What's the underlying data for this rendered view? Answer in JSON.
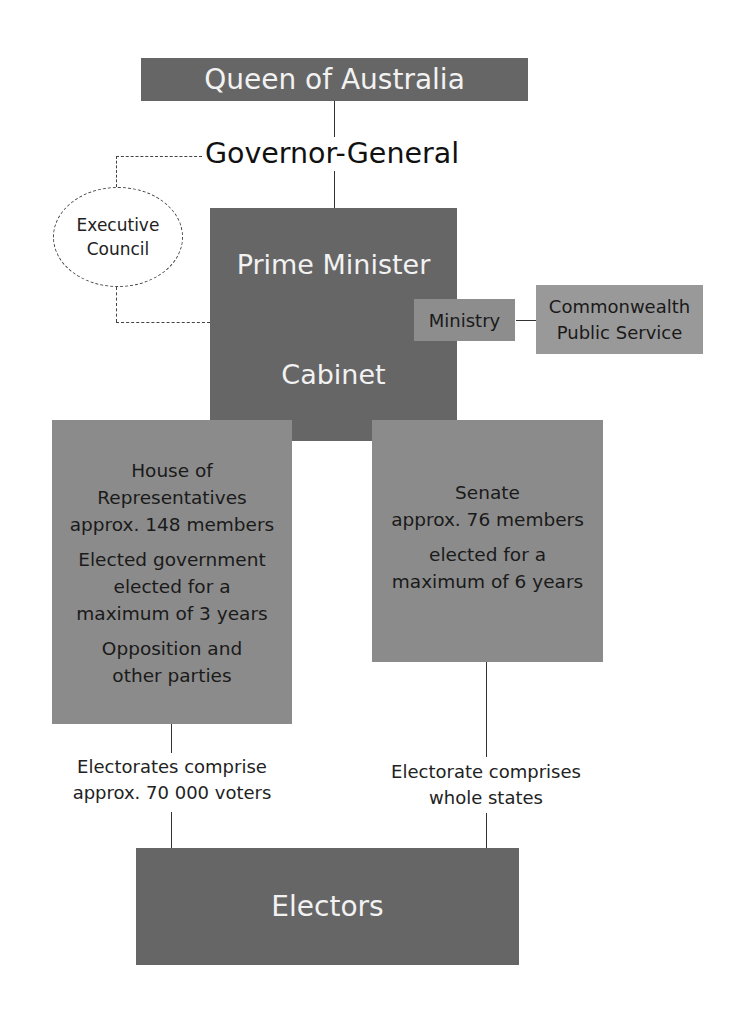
{
  "diagram": {
    "nodes": {
      "queen": {
        "label": "Queen of Australia"
      },
      "governor_general": {
        "label": "Governor-General"
      },
      "executive_council": {
        "line1": "Executive",
        "line2": "Council"
      },
      "prime_minister": {
        "label": "Prime Minister"
      },
      "cabinet": {
        "label": "Cabinet"
      },
      "ministry": {
        "label": "Ministry"
      },
      "public_service": {
        "line1": "Commonwealth",
        "line2": "Public Service"
      },
      "house": {
        "lines": [
          "House of",
          "Representatives",
          "approx. 148 members",
          "Elected government",
          "elected for a",
          "maximum of 3 years",
          "Opposition and",
          "other parties"
        ]
      },
      "senate": {
        "lines": [
          "Senate",
          "approx. 76 members",
          "elected for a",
          "maximum of 6 years"
        ]
      },
      "electors": {
        "label": "Electors"
      }
    },
    "annotations": {
      "house_electorates": {
        "line1": "Electorates comprise",
        "line2": "approx. 70 000 voters"
      },
      "senate_electorates": {
        "line1": "Electorate comprises",
        "line2": "whole states"
      }
    },
    "colors": {
      "dark_box": "#666666",
      "mid_box": "#8b8b8b",
      "line": "#333333"
    }
  }
}
